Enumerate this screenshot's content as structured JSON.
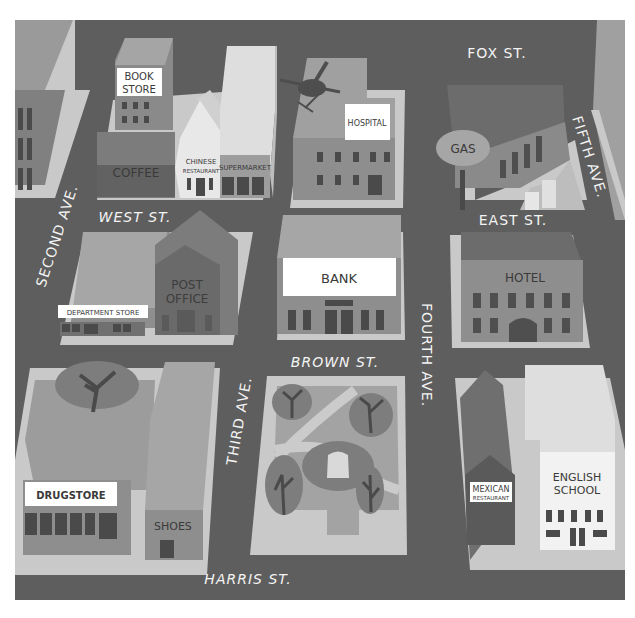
{
  "map": {
    "title": "Town map",
    "colors": {
      "road": "#5e5e5e",
      "sidewalk": "#c9c9c9",
      "block": "#8e8e8e",
      "building_dark": "#6c6c6c",
      "building_mid": "#8a8a8a",
      "building_light": "#b3b3b3",
      "building_pale": "#dcdcdc",
      "sign_bg": "#ffffff",
      "window": "#4a4a4a",
      "street_label": "#f4f4f4"
    },
    "streets": {
      "fox": "FOX ST.",
      "west": "WEST ST.",
      "east": "EAST ST.",
      "brown": "BROWN ST.",
      "harris": "HARRIS ST.",
      "second": "SECOND AVE.",
      "third": "THIRD AVE.",
      "fourth": "FOURTH AVE.",
      "fifth": "FIFTH AVE."
    },
    "places": {
      "book_store_1": "BOOK",
      "book_store_2": "STORE",
      "coffee": "COFFEE",
      "chinese_1": "CHINESE",
      "chinese_2": "RESTAURANT",
      "supermarket": "SUPERMARKET",
      "hospital": "HOSPITAL",
      "gas": "GAS",
      "department_store": "DEPARTMENT STORE",
      "post_office_1": "POST",
      "post_office_2": "OFFICE",
      "bank": "BANK",
      "hotel": "HOTEL",
      "drugstore": "DRUGSTORE",
      "shoes": "SHOES",
      "mexican_1": "MEXICAN",
      "mexican_2": "RESTAURANT",
      "english_school_1": "ENGLISH",
      "english_school_2": "SCHOOL"
    },
    "features": {
      "helicopter": "helicopter-icon",
      "park": "park",
      "trees": [
        "tree-icon",
        "tree-icon",
        "tree-icon",
        "tree-icon",
        "tree-icon"
      ]
    }
  }
}
